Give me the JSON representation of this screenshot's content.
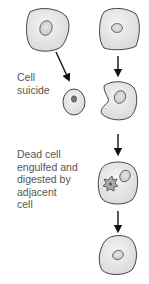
{
  "labels": {
    "cell_suicide": [
      "Cell",
      "suicide"
    ],
    "engulfed": [
      "Dead cell",
      "engulfed and",
      "digested by",
      "adjacent",
      "cell"
    ]
  },
  "colors": {
    "cell_fill": "#e8e8e8",
    "cell_stroke": "#333333",
    "nucleus_fill": "#d8d8d8",
    "arrow": "#111111",
    "text": "#555555"
  },
  "diagram": {
    "left_column": [
      "healthy cell",
      "condensed apoptotic cell"
    ],
    "right_column": [
      "healthy neighbor cell",
      "engulfing cell",
      "cell with digested dead cell",
      "restored healthy cell"
    ]
  }
}
